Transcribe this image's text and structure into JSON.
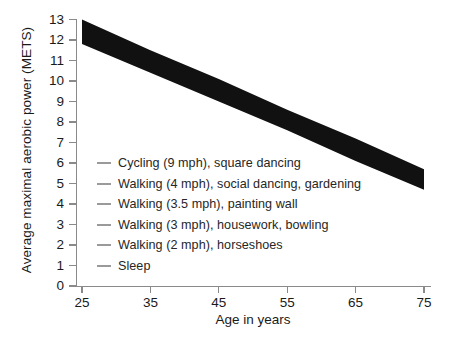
{
  "chart_data": {
    "type": "area",
    "title": "",
    "xlabel": "Age in years",
    "ylabel": "Average maximal aerobic power (METS)",
    "xlim": [
      25,
      75
    ],
    "ylim": [
      0,
      13
    ],
    "xticks": [
      25,
      35,
      45,
      55,
      65,
      75
    ],
    "yticks": [
      0,
      1,
      2,
      3,
      4,
      5,
      6,
      7,
      8,
      9,
      10,
      11,
      12,
      13
    ],
    "grid": false,
    "legend_position": "inside-lower-left",
    "band_color": "#111111",
    "axis_color": "#8a8a8a",
    "series": [
      {
        "name": "Average maximal aerobic power (upper bound)",
        "x": [
          25,
          35,
          45,
          55,
          65,
          75
        ],
        "values": [
          13.0,
          11.5,
          10.1,
          8.6,
          7.2,
          5.7
        ]
      },
      {
        "name": "Average maximal aerobic power (lower bound)",
        "x": [
          25,
          35,
          45,
          55,
          65,
          75
        ],
        "values": [
          11.8,
          10.4,
          9.0,
          7.6,
          6.1,
          4.7
        ]
      }
    ],
    "legend_entries": [
      {
        "label": "Cycling (9 mph), square dancing",
        "mets": 6
      },
      {
        "label": "Walking (4 mph), social dancing, gardening",
        "mets": 5
      },
      {
        "label": "Walking (3.5 mph), painting wall",
        "mets": 4
      },
      {
        "label": "Walking (3 mph), housework, bowling",
        "mets": 3
      },
      {
        "label": "Walking (2 mph), horseshoes",
        "mets": 2
      },
      {
        "label": "Sleep",
        "mets": 1
      }
    ]
  }
}
